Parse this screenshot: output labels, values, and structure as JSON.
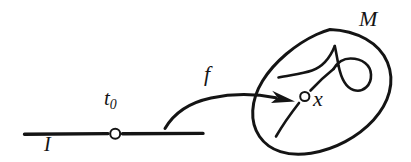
{
  "figure": {
    "kind": "hand-drawn-math-diagram",
    "background_color": "#ffffff",
    "ink_color": "#141414",
    "labels": {
      "interval": "I",
      "parameter": "t",
      "parameter_subscript": "0",
      "map": "f",
      "image_point": "x",
      "manifold": "M"
    },
    "elements": [
      {
        "name": "interval-line",
        "type": "line",
        "label": "I"
      },
      {
        "name": "t0-point-marker",
        "type": "open-circle",
        "label": "t0"
      },
      {
        "name": "map-arrow",
        "type": "curved-arrow",
        "label": "f"
      },
      {
        "name": "manifold-boundary",
        "type": "ellipse",
        "label": "M"
      },
      {
        "name": "manifold-curve",
        "type": "looped-curve",
        "label": ""
      },
      {
        "name": "x-point-marker",
        "type": "open-circle",
        "label": "x"
      }
    ]
  }
}
